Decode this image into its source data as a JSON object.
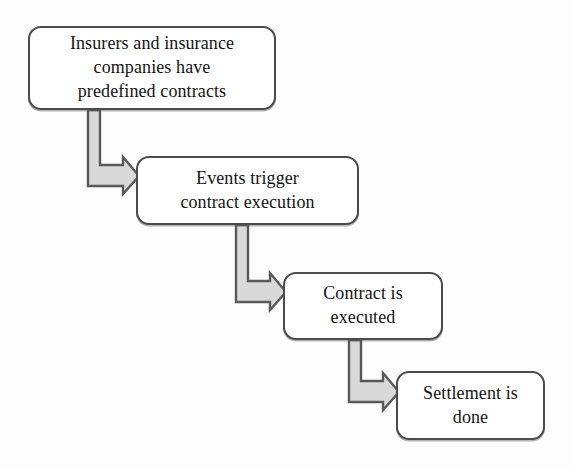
{
  "diagram": {
    "type": "flowchart",
    "orientation": "cascading-down-right",
    "colors": {
      "node_border": "#4b4b4b",
      "node_fill": "#ffffff",
      "text": "#131313",
      "arrow_fill": "#d9d9d9",
      "arrow_stroke": "#595959",
      "background": "#ffffff"
    },
    "nodes": [
      {
        "id": "node-1",
        "label": "Insurers and insurance\ncompanies have\npredefined contracts",
        "shape": "rounded-rectangle"
      },
      {
        "id": "node-2",
        "label": "Events trigger\ncontract execution",
        "shape": "rounded-rectangle"
      },
      {
        "id": "node-3",
        "label": "Contract is\nexecuted",
        "shape": "rounded-rectangle"
      },
      {
        "id": "node-4",
        "label": "Settlement is\ndone",
        "shape": "rounded-rectangle"
      }
    ],
    "connectors": [
      {
        "id": "connector-1",
        "from": "node-1",
        "to": "node-2",
        "style": "elbow-block-arrow",
        "direction": "down-then-right"
      },
      {
        "id": "connector-2",
        "from": "node-2",
        "to": "node-3",
        "style": "elbow-block-arrow",
        "direction": "down-then-right"
      },
      {
        "id": "connector-3",
        "from": "node-3",
        "to": "node-4",
        "style": "elbow-block-arrow",
        "direction": "down-then-right"
      }
    ]
  }
}
